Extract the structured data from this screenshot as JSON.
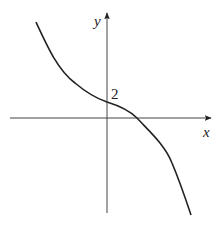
{
  "figure": {
    "axes": {
      "x_label": "x",
      "y_label": "y"
    },
    "annotations": {
      "y_intercept_label": "2"
    },
    "curve": {
      "description": "decreasing cubic-like curve passing through (0, 2), crossing x-axis at positive x",
      "color": "#222222"
    }
  }
}
